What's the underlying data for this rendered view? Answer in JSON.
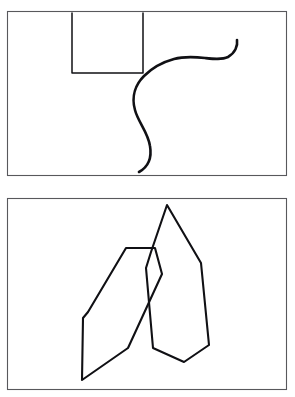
{
  "figure": {
    "background_color": "#ffffff",
    "width": 295,
    "height": 397,
    "panel_count": 2,
    "frame_color": "#58585c",
    "ink_color": "#101014"
  },
  "panels": [
    {
      "id": "panel-top",
      "label": "Top panel",
      "frame": {
        "x": 7,
        "y": 11,
        "width": 280,
        "height": 165
      },
      "shapes": [
        {
          "id": "open-rectangle",
          "name": "open-rectangle",
          "type": "polyline",
          "closed": false,
          "stroke_width": 1.5,
          "description": "Three-sided rectangle open at the top, flush with the panel's upper border",
          "points": [
            [
              72,
              13
            ],
            [
              72,
              73
            ],
            [
              143,
              73
            ],
            [
              143,
              13
            ]
          ]
        },
        {
          "id": "s-curve",
          "name": "s-curve",
          "type": "bezier-path",
          "closed": false,
          "stroke_width": 2.6,
          "description": "Long sinuous S shaped stroke with a hooked tail curling upward at the right",
          "path": "M 139 172 C 148 167 152 158 150 146 C 148 132 138 122 135 110 C 131 96 136 84 144 76 C 152 68 163 62 174 59 C 185 56 196 57 205 58 C 214 59 222 60 228 57 C 235 53 238 46 237 40",
          "endpoints": [
            [
              139,
              172
            ],
            [
              237,
              40
            ]
          ]
        }
      ]
    },
    {
      "id": "panel-bottom",
      "label": "Bottom panel",
      "frame": {
        "x": 7,
        "y": 198,
        "width": 280,
        "height": 192
      },
      "shapes": [
        {
          "id": "left-polygon",
          "name": "left-polygon",
          "type": "polygon",
          "closed": true,
          "stroke_width": 2.1,
          "description": "Irregular elongated heptagon tilted left, with a long spike reaching the panel floor",
          "points": [
            [
              126,
              248
            ],
            [
              155,
              248
            ],
            [
              162,
              274
            ],
            [
              128,
              348
            ],
            [
              82,
              380
            ],
            [
              83,
              318
            ],
            [
              88,
              312
            ]
          ]
        },
        {
          "id": "right-polygon",
          "name": "right-polygon",
          "type": "polygon",
          "closed": true,
          "stroke_width": 2.1,
          "description": "Irregular tall heptagon with a sharp apex at the top, overlapping the left polygon",
          "points": [
            [
              167,
              205
            ],
            [
              201,
              263
            ],
            [
              209,
              345
            ],
            [
              184,
              362
            ],
            [
              153,
              348
            ],
            [
              146,
              268
            ],
            [
              151,
              252
            ]
          ]
        }
      ]
    }
  ]
}
